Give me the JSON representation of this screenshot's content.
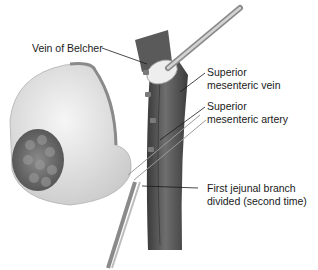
{
  "figure": {
    "labels": {
      "vein_of_belcher": {
        "lines": [
          "Vein of Belcher"
        ]
      },
      "smv": {
        "lines": [
          "Superior",
          "mesenteric vein"
        ]
      },
      "sma": {
        "lines": [
          "Superior",
          "mesenteric artery"
        ]
      },
      "first_jejunal": {
        "lines": [
          "First jejunal branch",
          "divided (second time)"
        ]
      }
    },
    "colors": {
      "background": "#ffffff",
      "vessel_dark": "#4a4a4a",
      "vessel_mid": "#6e6e6e",
      "tissue_light": "#e6e6e6",
      "tissue_dark": "#7a7a7a",
      "text": "#1a1a1a"
    }
  }
}
